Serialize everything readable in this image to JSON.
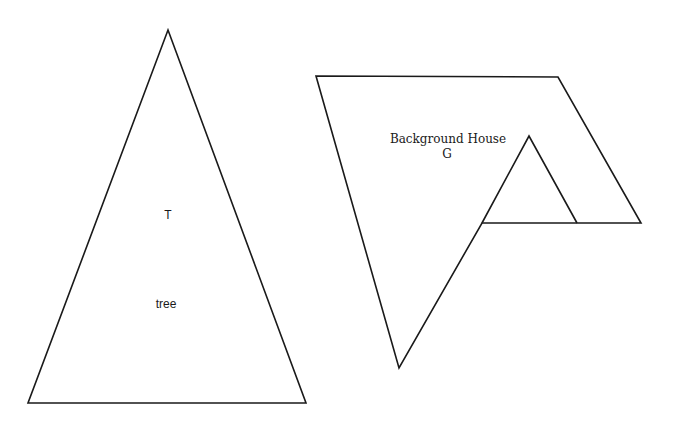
{
  "diagram": {
    "shapes": [
      {
        "id": "tree",
        "type": "triangle",
        "points": [
          [
            168,
            30
          ],
          [
            306,
            403
          ],
          [
            28,
            403
          ]
        ],
        "stroke": "#1a1a1a",
        "labels": {
          "symbol": "T",
          "name": "tree"
        }
      },
      {
        "id": "background-house",
        "type": "polygon",
        "points": [
          [
            316,
            76
          ],
          [
            558,
            77
          ],
          [
            641,
            223
          ],
          [
            482,
            223
          ],
          [
            399,
            368
          ]
        ],
        "stroke": "#1a1a1a",
        "inner_roof": {
          "points": [
            [
              482,
              223
            ],
            [
              529,
              136
            ],
            [
              577,
              223
            ]
          ]
        },
        "labels": {
          "name": "Background House",
          "symbol": "G"
        }
      }
    ]
  }
}
